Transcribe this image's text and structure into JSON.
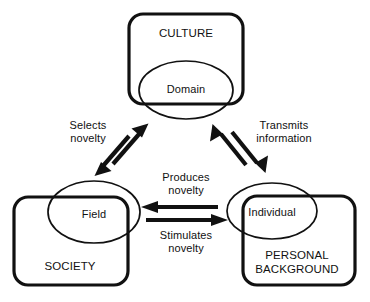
{
  "diagram": {
    "type": "node-link-diagram",
    "nodes": [
      {
        "id": "culture",
        "label": "CULTURE",
        "shape": "rounded-rectangle",
        "label_x": 186,
        "label_y": 34
      },
      {
        "id": "domain",
        "label": "Domain",
        "shape": "ellipse",
        "label_x": 186,
        "label_y": 89
      },
      {
        "id": "society",
        "label": "SOCIETY",
        "shape": "rounded-rectangle",
        "label_x": 70,
        "label_y": 267
      },
      {
        "id": "field",
        "label": "Field",
        "shape": "ellipse",
        "label_x": 94,
        "label_y": 214
      },
      {
        "id": "personal_background",
        "label": "PERSONAL\nBACKGROUND",
        "shape": "rounded-rectangle",
        "label_x": 297,
        "label_y": 263
      },
      {
        "id": "individual",
        "label": "Individual",
        "shape": "ellipse",
        "label_x": 272,
        "label_y": 212
      }
    ],
    "edges": [
      {
        "id": "selects-novelty",
        "label": "Selects\nnovelty",
        "from": "field",
        "to": "domain",
        "style": "double-headed",
        "label_x": 88,
        "label_y": 132
      },
      {
        "id": "transmits-information",
        "label": "Transmits\ninformation",
        "from": "domain",
        "to": "individual",
        "style": "double-headed",
        "label_x": 284,
        "label_y": 132
      },
      {
        "id": "produces-novelty",
        "label": "Produces\nnovelty",
        "from": "individual",
        "to": "field",
        "style": "single-headed",
        "label_x": 186,
        "label_y": 184
      },
      {
        "id": "stimulates-novelty",
        "label": "Stimulates\nnovelty",
        "from": "field",
        "to": "individual",
        "style": "single-headed",
        "label_x": 186,
        "label_y": 242
      }
    ],
    "colors": {
      "stroke": "#111111",
      "background": "#ffffff"
    }
  }
}
